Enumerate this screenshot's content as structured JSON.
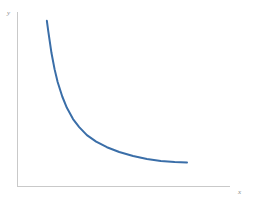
{
  "chart_data": {
    "type": "line",
    "title": "",
    "subtitle": "",
    "xlabel": "x",
    "ylabel": "y",
    "legend": [],
    "legend_position": "none",
    "grid": false,
    "ticks_shown": false,
    "tick_labels_x": [],
    "tick_labels_y": [],
    "xlim": [
      0,
      10
    ],
    "ylim": [
      0,
      10
    ],
    "annotations": [],
    "series": [
      {
        "name": "decay-curve",
        "color": "#3A6EA8",
        "line_width": 2,
        "description": "monotonic decreasing convex curve, hyperbolic decay approaching a horizontal asymptote",
        "x": [
          0.9,
          1.0,
          1.2,
          1.4,
          1.6,
          1.9,
          2.2,
          2.6,
          3.0,
          3.5,
          4.1,
          4.8,
          5.6,
          6.5,
          7.4,
          8.3,
          9.2,
          10.0
        ],
        "y": [
          9.7,
          9.0,
          7.7,
          6.7,
          5.9,
          5.0,
          4.3,
          3.6,
          3.1,
          2.6,
          2.2,
          1.85,
          1.55,
          1.3,
          1.12,
          1.0,
          0.93,
          0.9
        ]
      }
    ]
  },
  "axes": {
    "y_label_text": "y",
    "x_label_text": "x",
    "axis_color": "#c9c9c9",
    "background_color": "#ffffff",
    "curve_color": "#3A6EA8"
  }
}
